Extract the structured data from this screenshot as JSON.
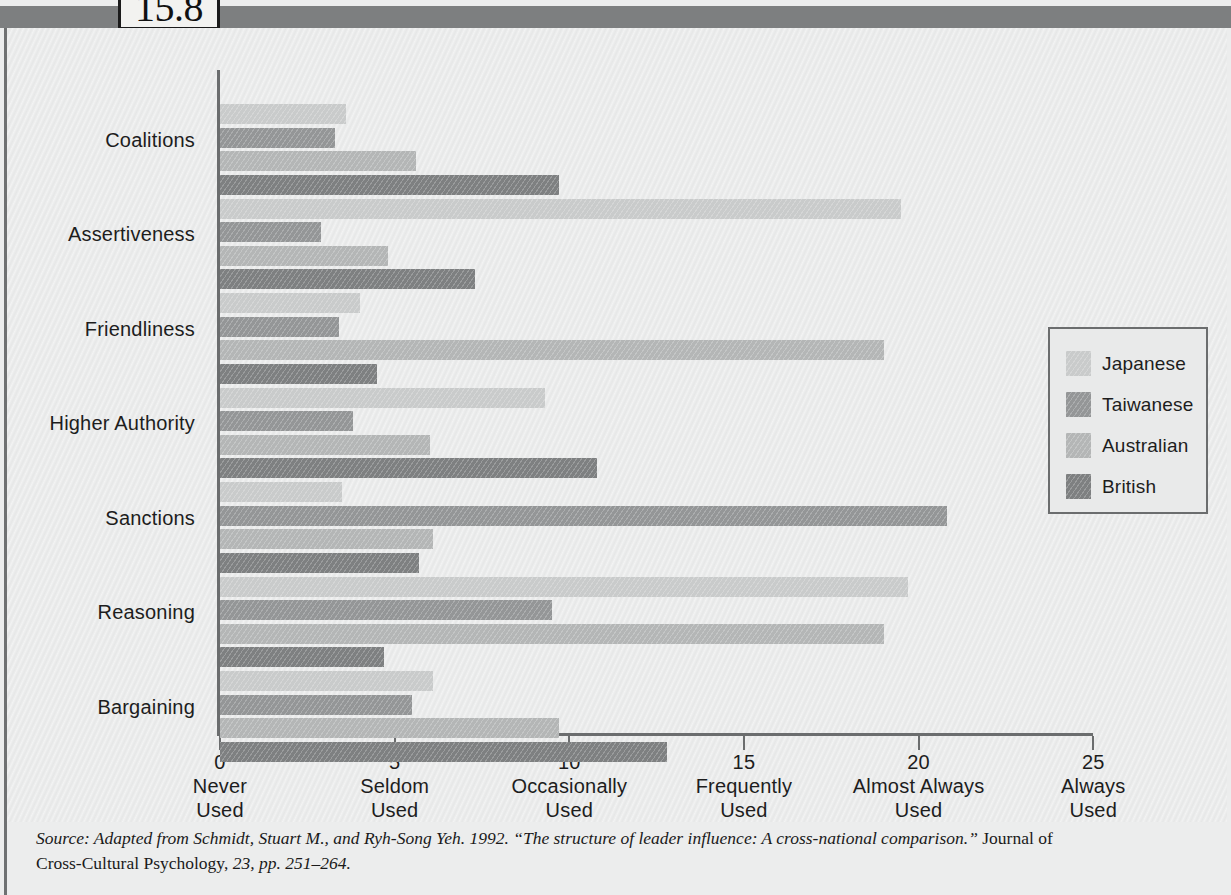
{
  "figure": {
    "number": "15.8"
  },
  "chart_data": {
    "type": "bar",
    "orientation": "horizontal",
    "title": "",
    "subtitle": "",
    "xlabel": "",
    "ylabel": "",
    "xlim": [
      0,
      25
    ],
    "grid": false,
    "legend_position": "right",
    "categories": [
      "Coalitions",
      "Assertiveness",
      "Friendliness",
      "Higher Authority",
      "Sanctions",
      "Reasoning",
      "Bargaining"
    ],
    "x_ticks": [
      {
        "value": 0,
        "label": "0",
        "word1": "Never",
        "word2": "Used"
      },
      {
        "value": 5,
        "label": "5",
        "word1": "Seldom",
        "word2": "Used"
      },
      {
        "value": 10,
        "label": "10",
        "word1": "Occasionally",
        "word2": "Used"
      },
      {
        "value": 15,
        "label": "15",
        "word1": "Frequently",
        "word2": "Used"
      },
      {
        "value": 20,
        "label": "20",
        "word1": "Almost Always",
        "word2": "Used"
      },
      {
        "value": 25,
        "label": "25",
        "word1": "Always",
        "word2": "Used"
      }
    ],
    "series": [
      {
        "name": "Japanese",
        "color": "#c9cbcb",
        "values": [
          3.6,
          19.5,
          4.0,
          9.3,
          3.5,
          19.7,
          6.1
        ]
      },
      {
        "name": "Taiwanese",
        "color": "#949697",
        "values": [
          3.3,
          2.9,
          3.4,
          3.8,
          20.8,
          9.5,
          5.5
        ]
      },
      {
        "name": "Australian",
        "color": "#b4b6b6",
        "values": [
          5.6,
          4.8,
          19.0,
          6.0,
          6.1,
          19.0,
          9.7
        ]
      },
      {
        "name": "British",
        "color": "#7e8081",
        "values": [
          9.7,
          7.3,
          4.5,
          10.8,
          5.7,
          4.7,
          12.8
        ]
      }
    ]
  },
  "legend": {
    "items": [
      {
        "label": "Japanese",
        "color": "#c9cbcb"
      },
      {
        "label": "Taiwanese",
        "color": "#949697"
      },
      {
        "label": "Australian",
        "color": "#b4b6b6"
      },
      {
        "label": "British",
        "color": "#7e8081"
      }
    ]
  },
  "source": {
    "line1_a": "Source: Adapted from Schmidt, Stuart M., and Ryh-Song Yeh. 1992. ",
    "line1_b": "“The structure of leader influence: A cross-national comparison.”",
    "line1_c": " Journal of",
    "line2_a": "Cross-Cultural Psychology, ",
    "line2_b": "23, pp. 251–264."
  }
}
